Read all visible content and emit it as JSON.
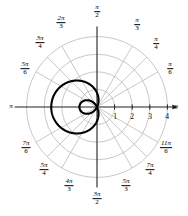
{
  "chart_data": {
    "type": "line",
    "title": "",
    "subtitle": "",
    "coordinate_system": "polar",
    "curve_equation": "r = 0.8 - 1.8 cos(theta)",
    "curve_family": "limacon with inner loop",
    "curve_color": "#000000",
    "curve_line_width": 2.1,
    "grid": true,
    "grid_color": "#b0b0b0",
    "axis_color": "#202020",
    "radial_ticks": [
      1,
      2,
      3,
      4
    ],
    "radial_tick_labels": [
      "1",
      "2",
      "3",
      "4"
    ],
    "rlim": [
      0,
      4
    ],
    "radial_gridlines": [
      1,
      2,
      3,
      4
    ],
    "angular_gridlines_deg": [
      0,
      30,
      45,
      60,
      90,
      120,
      135,
      150,
      180,
      210,
      225,
      240,
      270,
      300,
      315,
      330
    ],
    "angle_labels": [
      {
        "id": "zero",
        "text_plain": "0",
        "type": "integer",
        "deg": 0
      },
      {
        "id": "pi-over-6",
        "num": "π",
        "den": "6",
        "type": "fraction",
        "deg": 30
      },
      {
        "id": "pi-over-4",
        "num": "π",
        "den": "4",
        "type": "fraction",
        "deg": 45
      },
      {
        "id": "pi-over-3",
        "num": "π",
        "den": "3",
        "type": "fraction",
        "deg": 60
      },
      {
        "id": "pi-over-2",
        "num": "π",
        "den": "2",
        "type": "fraction",
        "deg": 90
      },
      {
        "id": "two-pi-over-3",
        "num": "2π",
        "den": "3",
        "type": "fraction",
        "deg": 120
      },
      {
        "id": "three-pi-over-4",
        "num": "3π",
        "den": "4",
        "type": "fraction",
        "deg": 135
      },
      {
        "id": "five-pi-over-6",
        "num": "5π",
        "den": "6",
        "type": "fraction",
        "deg": 150
      },
      {
        "id": "pi",
        "text_plain": "π",
        "type": "symbol",
        "deg": 180
      },
      {
        "id": "seven-pi-over-6",
        "num": "7π",
        "den": "6",
        "type": "fraction",
        "deg": 210
      },
      {
        "id": "five-pi-over-4",
        "num": "5π",
        "den": "4",
        "type": "fraction",
        "deg": 225
      },
      {
        "id": "four-pi-over-3",
        "num": "4π",
        "den": "3",
        "type": "fraction",
        "deg": 240
      },
      {
        "id": "three-pi-over-2",
        "num": "3π",
        "den": "2",
        "type": "fraction",
        "deg": 270
      },
      {
        "id": "five-pi-over-3",
        "num": "5π",
        "den": "3",
        "type": "fraction",
        "deg": 300
      },
      {
        "id": "seven-pi-over-4",
        "num": "7π",
        "den": "4",
        "type": "fraction",
        "deg": 315
      },
      {
        "id": "eleven-pi-over-6",
        "num": "11π",
        "den": "6",
        "type": "fraction",
        "deg": 330
      }
    ]
  },
  "labels": {
    "angles": {
      "zero": "0",
      "pi": "π",
      "pi_over_2_num": "π",
      "pi_over_2_den": "2",
      "pi_over_3_num": "π",
      "pi_over_3_den": "3",
      "pi_over_4_num": "π",
      "pi_over_4_den": "4",
      "pi_over_6_num": "π",
      "pi_over_6_den": "6",
      "two_pi_over_3_num": "2π",
      "two_pi_over_3_den": "3",
      "three_pi_over_4_num": "3π",
      "three_pi_over_4_den": "4",
      "five_pi_over_6_num": "5π",
      "five_pi_over_6_den": "6",
      "seven_pi_over_6_num": "7π",
      "seven_pi_over_6_den": "6",
      "five_pi_over_4_num": "5π",
      "five_pi_over_4_den": "4",
      "four_pi_over_3_num": "4π",
      "four_pi_over_3_den": "3",
      "three_pi_over_2_num": "3π",
      "three_pi_over_2_den": "2",
      "five_pi_over_3_num": "5π",
      "five_pi_over_3_den": "3",
      "seven_pi_over_4_num": "7π",
      "seven_pi_over_4_den": "4",
      "eleven_pi_over_6_num": "11π",
      "eleven_pi_over_6_den": "6"
    },
    "radial": {
      "r1": "1",
      "r2": "2",
      "r3": "3",
      "r4": "4"
    }
  },
  "geometry": {
    "origin_x": 97,
    "origin_y": 107,
    "unit_px": 17.6
  }
}
